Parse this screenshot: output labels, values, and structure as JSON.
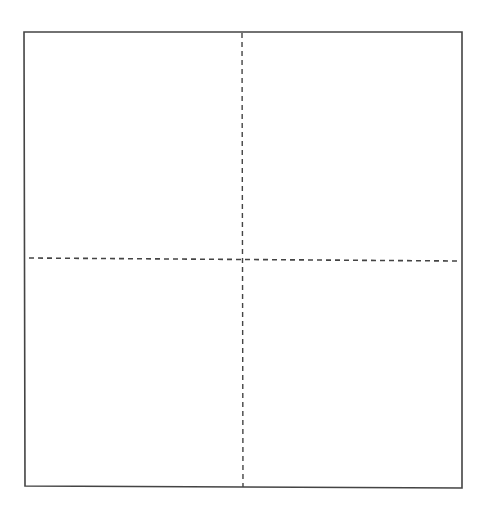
{
  "diagram": {
    "type": "quadrant-grid",
    "background": "#ffffff",
    "stroke_color": "#444444",
    "frame": {
      "x1": 24,
      "y1": 32,
      "x2": 462,
      "y2": 32,
      "x3": 462,
      "y3": 488,
      "x4": 25,
      "y4": 486,
      "stroke_width": 1.6,
      "style": "solid"
    },
    "vertical_divider": {
      "x1": 242,
      "y1": 33,
      "x2": 243,
      "y2": 487,
      "stroke_width": 1.4,
      "style": "dashed",
      "dash": "5 4"
    },
    "horizontal_divider": {
      "x1": 29,
      "y1": 258,
      "x2": 458,
      "y2": 261,
      "stroke_width": 1.6,
      "style": "dashed",
      "dash": "5 4"
    },
    "quadrants": [
      {
        "id": "top-left",
        "label": ""
      },
      {
        "id": "top-right",
        "label": ""
      },
      {
        "id": "bottom-left",
        "label": ""
      },
      {
        "id": "bottom-right",
        "label": ""
      }
    ]
  }
}
